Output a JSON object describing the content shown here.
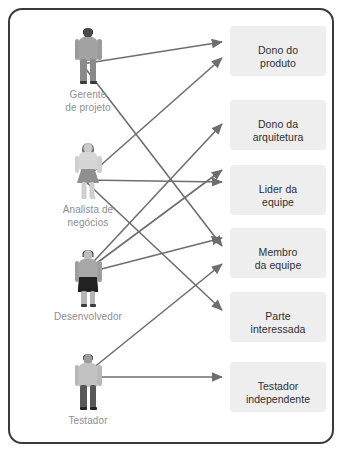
{
  "diagram": {
    "type": "bipartite-mapping",
    "title_visible": false,
    "frame_border_color": "#3a3a3a",
    "chip_background_color": "#eeeeee",
    "chip_text_color": "#2f2f2f",
    "actor_label_color": "#8e8e8e",
    "arrow_color": "#6e6e6e"
  },
  "actors": [
    {
      "id": "gerente-de-projeto",
      "label": "Gerente\nde projeto",
      "icon": "person-male-icon",
      "x": 30,
      "y": 18,
      "anchor_x": 72,
      "anchor_y": 54
    },
    {
      "id": "analista-de-negocios",
      "label": "Analista de\nnegócios",
      "icon": "person-female-icon",
      "x": 30,
      "y": 133,
      "anchor_x": 74,
      "anchor_y": 170
    },
    {
      "id": "desenvolvedor",
      "label": "Desenvolvedor",
      "icon": "person-developer-icon",
      "x": 30,
      "y": 240,
      "anchor_x": 72,
      "anchor_y": 264
    },
    {
      "id": "testador",
      "label": "Testador",
      "icon": "person-tester-icon",
      "x": 30,
      "y": 344,
      "anchor_x": 72,
      "anchor_y": 367
    }
  ],
  "roles": [
    {
      "id": "dono-do-produto",
      "label": "Dono do\nproduto",
      "x": 220,
      "y": 16,
      "anchor_x": 216,
      "anchor_y": 33
    },
    {
      "id": "dono-da-arquitetura",
      "label": "Dono da\narquitetura",
      "x": 220,
      "y": 90,
      "anchor_x": 216,
      "anchor_y": 114
    },
    {
      "id": "lider-da-equipe",
      "label": "Lider da\nequipe",
      "x": 220,
      "y": 155,
      "anchor_x": 216,
      "anchor_y": 172
    },
    {
      "id": "membro-da-equipe",
      "label": "Membro\nda equipe",
      "x": 220,
      "y": 218,
      "anchor_x": 216,
      "anchor_y": 243
    },
    {
      "id": "parte-interessada",
      "label": "Parte\ninteressada",
      "x": 220,
      "y": 282,
      "anchor_x": 216,
      "anchor_y": 300
    },
    {
      "id": "testador-independente",
      "label": "Testador\nindependente",
      "x": 220,
      "y": 352,
      "anchor_x": 216,
      "anchor_y": 367
    }
  ],
  "edges": [
    {
      "id": "e1",
      "from": "gerente-de-projeto",
      "to": "dono-do-produto",
      "x1": 72,
      "y1": 54,
      "x2": 212,
      "y2": 32
    },
    {
      "id": "e2",
      "from": "gerente-de-projeto",
      "to": "membro-da-equipe",
      "x1": 72,
      "y1": 54,
      "x2": 212,
      "y2": 236
    },
    {
      "id": "e3",
      "from": "analista-de-negocios",
      "to": "dono-do-produto",
      "x1": 74,
      "y1": 170,
      "x2": 212,
      "y2": 48
    },
    {
      "id": "e4",
      "from": "analista-de-negocios",
      "to": "lider-da-equipe",
      "x1": 74,
      "y1": 170,
      "x2": 212,
      "y2": 172
    },
    {
      "id": "e5",
      "from": "analista-de-negocios",
      "to": "parte-interessada",
      "x1": 74,
      "y1": 170,
      "x2": 212,
      "y2": 300
    },
    {
      "id": "e6",
      "from": "desenvolvedor",
      "to": "dono-da-arquitetura",
      "x1": 72,
      "y1": 264,
      "x2": 212,
      "y2": 114
    },
    {
      "id": "e7",
      "from": "desenvolvedor",
      "to": "lider-da-equipe",
      "x1": 72,
      "y1": 264,
      "x2": 212,
      "y2": 160
    },
    {
      "id": "e8",
      "from": "desenvolvedor",
      "to": "membro-da-equipe",
      "x1": 72,
      "y1": 264,
      "x2": 212,
      "y2": 228
    },
    {
      "id": "e9",
      "from": "testador",
      "to": "membro-da-equipe",
      "x1": 72,
      "y1": 367,
      "x2": 212,
      "y2": 254
    },
    {
      "id": "e10",
      "from": "testador",
      "to": "testador-independente",
      "x1": 72,
      "y1": 367,
      "x2": 212,
      "y2": 367
    }
  ]
}
